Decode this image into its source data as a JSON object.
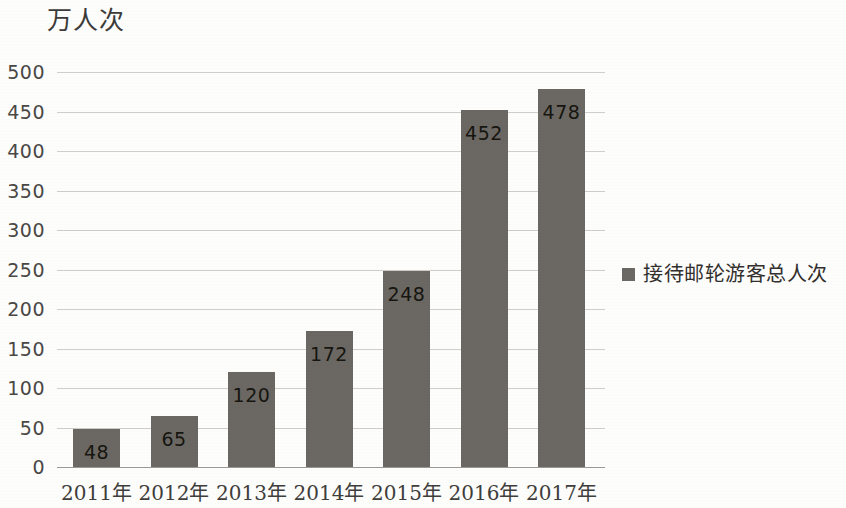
{
  "chart_data": {
    "type": "bar",
    "title": "万人次",
    "xlabel": "",
    "ylabel": "万人次",
    "categories": [
      "2011年",
      "2012年",
      "2013年",
      "2014年",
      "2015年",
      "2016年",
      "2017年"
    ],
    "values": [
      48,
      65,
      120,
      172,
      248,
      452,
      478
    ],
    "series": [
      {
        "name": "接待邮轮游客总人次",
        "values": [
          48,
          65,
          120,
          172,
          248,
          452,
          478
        ],
        "color": "#6b6863"
      }
    ],
    "ylim": [
      0,
      500
    ],
    "ytick_step": 50,
    "yticks": [
      "500",
      "450",
      "400",
      "350",
      "300",
      "250",
      "200",
      "150",
      "100",
      "50",
      "0"
    ],
    "grid": true,
    "legend_position": "right",
    "legend_entries": [
      "接待邮轮游客总人次"
    ],
    "data_labels": [
      "48",
      "65",
      "120",
      "172",
      "248",
      "452",
      "478"
    ],
    "data_label_position": "inside-top"
  },
  "legend": {
    "marker": "filled-square",
    "label": "接待邮轮游客总人次"
  },
  "axis": {
    "unit_title": "万人次"
  }
}
